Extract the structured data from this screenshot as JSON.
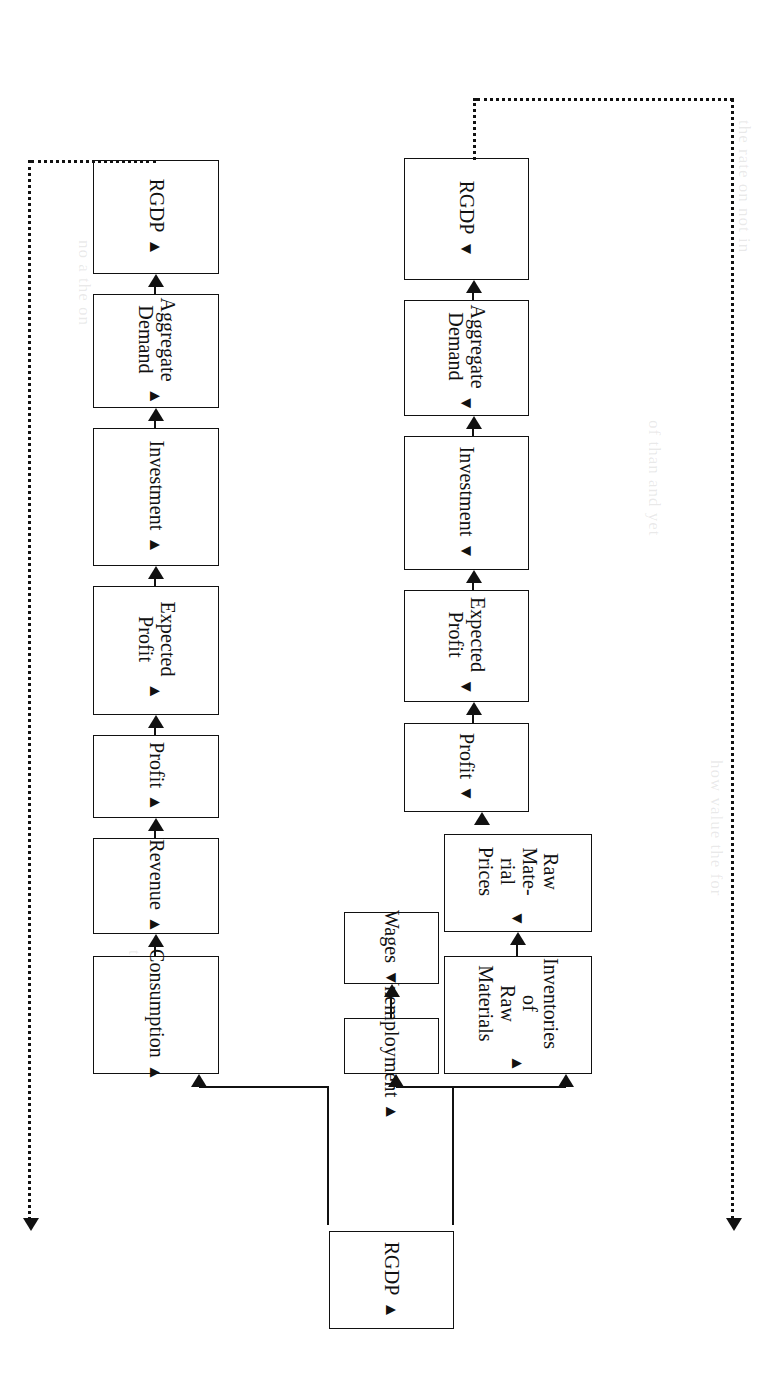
{
  "diagram": {
    "orientation": "rotated-90",
    "line_color": "#111111",
    "background": "#ffffff",
    "root": {
      "label": "RGDP",
      "direction_mark": "▲"
    },
    "left_branch": {
      "name": "contractionary-chain",
      "nodes": [
        {
          "label": "Unemployment",
          "direction_mark": "▲"
        },
        {
          "label": "Wages",
          "direction_mark": "▼"
        },
        {
          "label": "Inventories of\nRaw Materials",
          "direction_mark": "▲"
        },
        {
          "label": "Raw Mate-\nrial Prices",
          "direction_mark": "▼"
        },
        {
          "label": "Profit",
          "direction_mark": "▼"
        },
        {
          "label": "Expected\nProfit",
          "direction_mark": "▼"
        },
        {
          "label": "Investment",
          "direction_mark": "▼"
        },
        {
          "label": "Aggregate\nDemand",
          "direction_mark": "▼"
        },
        {
          "label": "RGDP",
          "direction_mark": "▼"
        }
      ]
    },
    "right_branch": {
      "name": "expansionary-chain",
      "nodes": [
        {
          "label": "Consumption",
          "direction_mark": "▲"
        },
        {
          "label": "Revenue",
          "direction_mark": "▲"
        },
        {
          "label": "Profit",
          "direction_mark": "▲"
        },
        {
          "label": "Expected\nProfit",
          "direction_mark": "▲"
        },
        {
          "label": "Investment",
          "direction_mark": "▲"
        },
        {
          "label": "Aggregate\nDemand",
          "direction_mark": "▲"
        },
        {
          "label": "RGDP",
          "direction_mark": "▲"
        }
      ]
    },
    "feedback_loops": [
      {
        "name": "left-feedback",
        "from": "left RGDP",
        "to": "root RGDP",
        "style": "dotted"
      },
      {
        "name": "right-feedback",
        "from": "right RGDP",
        "to": "root RGDP",
        "style": "dotted"
      }
    ],
    "ghost_text": [
      "the rate",
      "on",
      "not",
      "in",
      "of",
      "than",
      "and",
      "yet",
      "how",
      "value",
      "the",
      "for",
      "no",
      "a"
    ]
  }
}
